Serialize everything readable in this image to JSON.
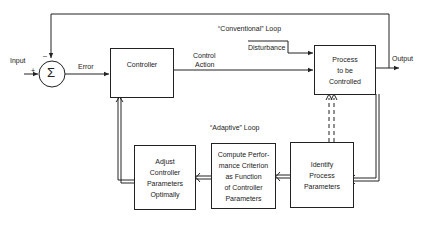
{
  "diagram": {
    "type": "block-diagram",
    "labels": {
      "input": "Input",
      "plus": "+",
      "minus": "–",
      "error": "Error",
      "control_action_1": "Control",
      "control_action_2": "Action",
      "disturbance": "Disturbance",
      "output": "Output",
      "conventional_loop": "“Conventional”  Loop",
      "adaptive_loop": "“Adaptive”  Loop",
      "sum_symbol": "Σ"
    },
    "blocks": {
      "controller": {
        "lines": [
          "Controller"
        ]
      },
      "process": {
        "lines": [
          "Process",
          "to be",
          "Controlled"
        ]
      },
      "identify": {
        "lines": [
          "Identify",
          "Process",
          "Parameters"
        ]
      },
      "compute": {
        "lines": [
          "Compute Perfor-",
          "mance Criterion",
          "as Function",
          "of Controller",
          "Parameters"
        ]
      },
      "adjust": {
        "lines": [
          "Adjust",
          "Controller",
          "Parameters",
          "Optimally"
        ]
      }
    },
    "colors": {
      "line": "#222222",
      "background": "#ffffff"
    }
  }
}
